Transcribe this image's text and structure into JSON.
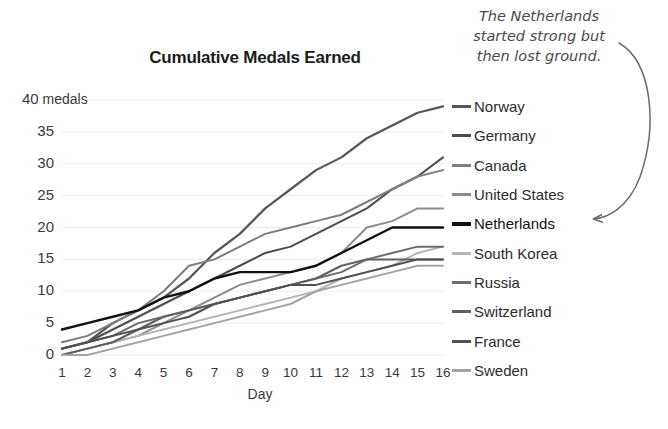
{
  "chart_data": {
    "type": "line",
    "title": "Cumulative Medals Earned",
    "xlabel": "Day",
    "ylabel": "",
    "y_unit_label": "medals",
    "x": [
      1,
      2,
      3,
      4,
      5,
      6,
      7,
      8,
      9,
      10,
      11,
      12,
      13,
      14,
      15,
      16
    ],
    "xlim": [
      1,
      16
    ],
    "ylim": [
      0,
      40
    ],
    "yticks": [
      0,
      5,
      10,
      15,
      20,
      25,
      30,
      35,
      40
    ],
    "ytick_labels": [
      "0",
      "5",
      "10",
      "15",
      "20",
      "25",
      "30",
      "35",
      "40 medals"
    ],
    "xtick_labels": [
      "1",
      "2",
      "3",
      "4",
      "5",
      "6",
      "7",
      "8",
      "9",
      "10",
      "11",
      "12",
      "13",
      "14",
      "15",
      "16"
    ],
    "grid": true,
    "grid_axis": "y",
    "legend_position": "right",
    "series": [
      {
        "name": "Norway",
        "color": "#55565a",
        "width": 2.2,
        "values": [
          1,
          2,
          5,
          7,
          9,
          12,
          16,
          19,
          23,
          26,
          29,
          31,
          34,
          36,
          38,
          39
        ]
      },
      {
        "name": "Germany",
        "color": "#4c4d51",
        "width": 2.0,
        "values": [
          1,
          2,
          4,
          6,
          8,
          10,
          12,
          14,
          16,
          17,
          19,
          21,
          23,
          26,
          28,
          31
        ]
      },
      {
        "name": "Canada",
        "color": "#7c7d81",
        "width": 2.0,
        "values": [
          2,
          3,
          5,
          7,
          10,
          14,
          15,
          17,
          19,
          20,
          21,
          22,
          24,
          26,
          28,
          29
        ]
      },
      {
        "name": "United States",
        "color": "#8a8b8f",
        "width": 2.0,
        "values": [
          0,
          1,
          2,
          3,
          5,
          7,
          9,
          11,
          12,
          13,
          14,
          16,
          20,
          21,
          23,
          23
        ]
      },
      {
        "name": "Netherlands",
        "color": "#121212",
        "width": 2.4,
        "values": [
          4,
          5,
          6,
          7,
          9,
          10,
          12,
          13,
          13,
          13,
          14,
          16,
          18,
          20,
          20,
          20
        ]
      },
      {
        "name": "South Korea",
        "color": "#b4b5b8",
        "width": 2.0,
        "values": [
          0,
          1,
          2,
          3,
          4,
          5,
          6,
          7,
          8,
          9,
          10,
          12,
          13,
          14,
          16,
          17
        ]
      },
      {
        "name": "Russia",
        "color": "#6b6c70",
        "width": 2.0,
        "values": [
          1,
          2,
          3,
          5,
          6,
          7,
          8,
          9,
          10,
          11,
          12,
          13,
          15,
          16,
          17,
          17
        ]
      },
      {
        "name": "Switzerland",
        "color": "#5e5f63",
        "width": 2.0,
        "values": [
          0,
          1,
          2,
          4,
          6,
          7,
          8,
          9,
          10,
          11,
          12,
          14,
          15,
          15,
          15,
          15
        ]
      },
      {
        "name": "France",
        "color": "#4f5054",
        "width": 2.0,
        "values": [
          1,
          2,
          3,
          4,
          5,
          6,
          8,
          9,
          10,
          11,
          11,
          12,
          13,
          14,
          15,
          15
        ]
      },
      {
        "name": "Sweden",
        "color": "#a3a4a8",
        "width": 2.0,
        "values": [
          0,
          0,
          1,
          2,
          3,
          4,
          5,
          6,
          7,
          8,
          10,
          11,
          12,
          13,
          14,
          14
        ]
      }
    ],
    "annotations": [
      {
        "text": "The Netherlands started strong but then lost ground.",
        "lines": [
          "The Netherlands",
          "started strong but",
          "then lost ground."
        ],
        "target": "Netherlands",
        "arrow": "curved-left"
      }
    ]
  },
  "legend": {
    "items": [
      {
        "label": "Norway"
      },
      {
        "label": "Germany"
      },
      {
        "label": "Canada"
      },
      {
        "label": "United States"
      },
      {
        "label": "Netherlands"
      },
      {
        "label": "South Korea"
      },
      {
        "label": "Russia"
      },
      {
        "label": "Switzerland"
      },
      {
        "label": "France"
      },
      {
        "label": "Sweden"
      }
    ]
  },
  "colors": {
    "background": "#ffffff",
    "grid": "#ededed",
    "text": "#3a3a3a",
    "title": "#1b1b1b",
    "annotation": "#4a4a4a",
    "highlight": "#121212"
  }
}
